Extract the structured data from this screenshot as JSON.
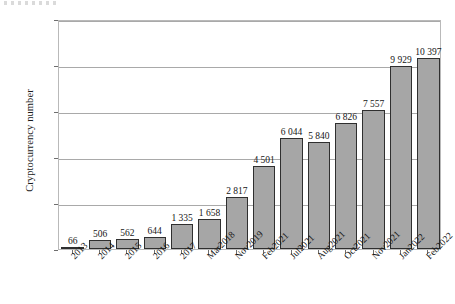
{
  "chart_data": {
    "type": "bar",
    "title": "",
    "subtitle": "",
    "xlabel": "",
    "ylabel": "Cryptocurrency number",
    "ylim": [
      0,
      12500
    ],
    "ytick_labels": [
      "0",
      "2 500",
      "5 000",
      "7 500",
      "10 000",
      "12 500"
    ],
    "ytick_values": [
      0,
      2500,
      5000,
      7500,
      10000,
      12500
    ],
    "grid": "horizontal",
    "legend": "none",
    "categories": [
      "2013",
      "2014",
      "2015",
      "2016",
      "2017",
      "Mar2018",
      "Nov2019",
      "Feb2021",
      "Jul2021",
      "Aug2021",
      "Oct2021",
      "Nov2021",
      "Jan2022",
      "Feb2022"
    ],
    "values": [
      66,
      506,
      562,
      644,
      1335,
      1658,
      2817,
      4501,
      6044,
      5840,
      6826,
      7557,
      9929,
      10397
    ],
    "value_labels": [
      "66",
      "506",
      "562",
      "644",
      "1 335",
      "1 658",
      "2 817",
      "4 501",
      "6 044",
      "5 840",
      "6 826",
      "7 557",
      "9 929",
      "10 397"
    ],
    "bar_fill_color": "#a6a6a6",
    "bar_edge_color": "#2f2f2f",
    "grid_color": "#a9a9a9",
    "frame_color": "#b9b9b9",
    "text_color": "#161616"
  }
}
